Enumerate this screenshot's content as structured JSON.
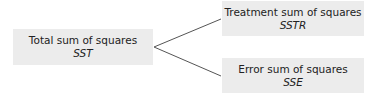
{
  "diagram": {
    "root": {
      "title": "Total sum of squares",
      "abbr": "SST"
    },
    "children": [
      {
        "title": "Treatment sum of squares",
        "abbr": "SSTR"
      },
      {
        "title": "Error sum of squares",
        "abbr": "SSE"
      }
    ],
    "colors": {
      "box_fill": "#ececec",
      "line": "#555555",
      "text": "#222222"
    }
  }
}
